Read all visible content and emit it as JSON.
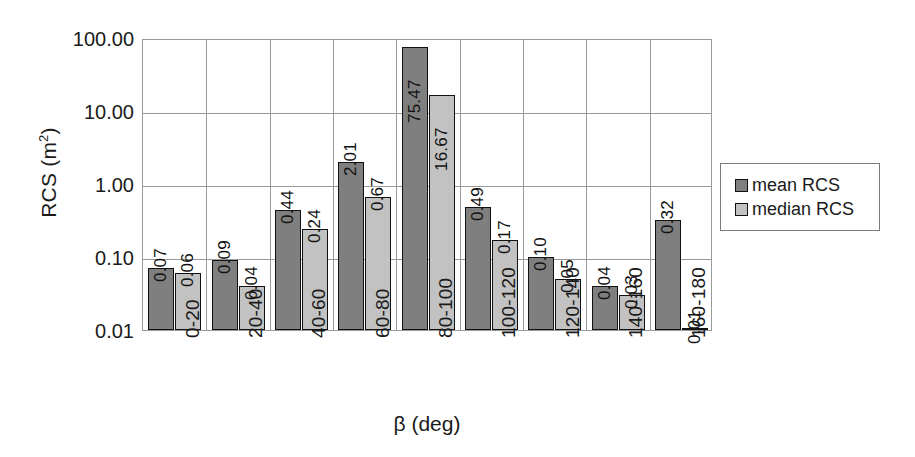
{
  "chart_data": {
    "type": "bar",
    "title": "",
    "xlabel": "β (deg)",
    "ylabel": "RCS (m²)",
    "ylabel_base": "RCS (m",
    "ylabel_sup": "2",
    "ylabel_tail": ")",
    "yscale": "log",
    "ylim": [
      0.01,
      100
    ],
    "grid": "both",
    "legend_position": "right",
    "categories": [
      "0-20",
      "20-40",
      "40-60",
      "60-80",
      "80-100",
      "100-120",
      "120-140",
      "140-160",
      "160-180"
    ],
    "ytick_labels": [
      "100.00",
      "10.00",
      "1.00",
      "0.10",
      "0.01"
    ],
    "ytick_values": [
      100,
      10,
      1,
      0.1,
      0.01
    ],
    "series": [
      {
        "name": "mean RCS",
        "color": "#7f7f7f",
        "values": [
          0.07,
          0.09,
          0.44,
          2.01,
          75.47,
          0.49,
          0.1,
          0.04,
          0.32
        ],
        "labels": [
          "0.07",
          "0.09",
          "0.44",
          "2.01",
          "75.47",
          "0.49",
          "0.10",
          "0.04",
          "0.32"
        ]
      },
      {
        "name": "median RCS",
        "color": "#c2c2c2",
        "values": [
          0.06,
          0.04,
          0.24,
          0.67,
          16.67,
          0.17,
          0.05,
          0.03,
          0.01
        ],
        "labels": [
          "0.06",
          "0.04",
          "0.24",
          "0.67",
          "16.67",
          "0.17",
          "0.05",
          "0.03",
          "0.01"
        ]
      }
    ]
  },
  "legend": {
    "entries": [
      {
        "label": "mean RCS",
        "swatch": "mean"
      },
      {
        "label": "median RCS",
        "swatch": "median"
      }
    ]
  },
  "axes": {
    "y_title": "RCS (m",
    "y_title_sup": "2",
    "y_title_tail": ")",
    "x_title": "β (deg)"
  }
}
